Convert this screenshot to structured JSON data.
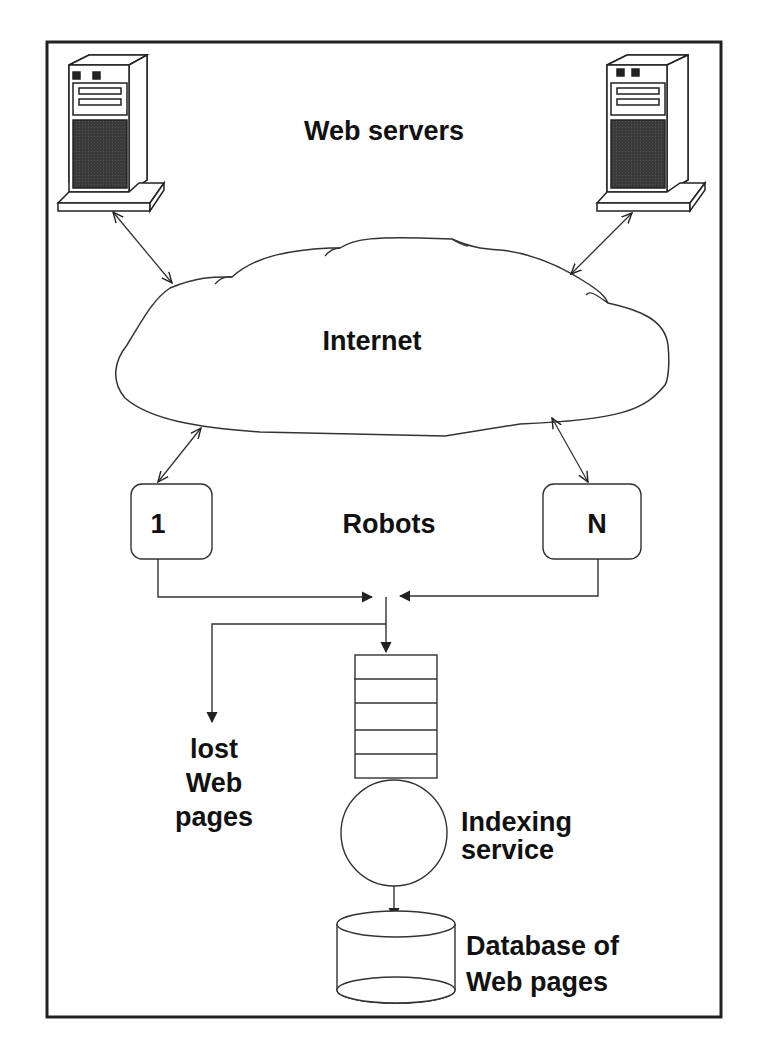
{
  "diagram": {
    "labels": {
      "web_servers": "Web servers",
      "internet": "Internet",
      "robots": "Robots",
      "robot_first": "1",
      "robot_last": "N",
      "lost_line1": "lost",
      "lost_line2": "Web",
      "lost_line3": "pages",
      "indexing_line1": "Indexing",
      "indexing_line2": "service",
      "database_line1": "Database of",
      "database_line2": "Web pages"
    },
    "nodes": [
      {
        "id": "server-left",
        "type": "server-icon"
      },
      {
        "id": "server-right",
        "type": "server-icon"
      },
      {
        "id": "internet",
        "type": "cloud"
      },
      {
        "id": "robot-1",
        "type": "rounded-box"
      },
      {
        "id": "robot-n",
        "type": "rounded-box"
      },
      {
        "id": "queue",
        "type": "queue",
        "slots": 5
      },
      {
        "id": "indexing-service",
        "type": "circle"
      },
      {
        "id": "database",
        "type": "cylinder"
      },
      {
        "id": "lost-pages",
        "type": "text-sink"
      }
    ],
    "edges": [
      {
        "from": "server-left",
        "to": "internet",
        "bidirectional": true
      },
      {
        "from": "server-right",
        "to": "internet",
        "bidirectional": true
      },
      {
        "from": "internet",
        "to": "robot-1",
        "bidirectional": true
      },
      {
        "from": "internet",
        "to": "robot-n",
        "bidirectional": true
      },
      {
        "from": "robot-1",
        "to": "queue"
      },
      {
        "from": "robot-n",
        "to": "queue"
      },
      {
        "from": "queue",
        "to": "lost-pages"
      },
      {
        "from": "queue",
        "to": "indexing-service"
      },
      {
        "from": "indexing-service",
        "to": "database"
      }
    ],
    "colors": {
      "stroke": "#222222",
      "screen": "#3a3a3a",
      "background": "#ffffff"
    }
  }
}
